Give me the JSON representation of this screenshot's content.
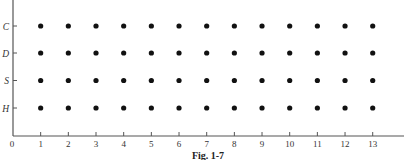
{
  "chart_data": {
    "type": "scatter",
    "title": "",
    "caption": "Fig. 1-7",
    "xlabel": "",
    "ylabel": "",
    "x_ticks": [
      "0",
      "1",
      "2",
      "3",
      "4",
      "5",
      "6",
      "7",
      "8",
      "9",
      "10",
      "11",
      "12",
      "13"
    ],
    "x_range": [
      0,
      13.5
    ],
    "y_categories": [
      "H",
      "S",
      "D",
      "C"
    ],
    "grid": false,
    "legend": "none",
    "points": {
      "x_values": [
        1,
        2,
        3,
        4,
        5,
        6,
        7,
        8,
        9,
        10,
        11,
        12,
        13
      ],
      "y_values": [
        "H",
        "S",
        "D",
        "C"
      ],
      "description": "Every combination of x in 1..13 and y in {H, S, D, C}"
    }
  }
}
